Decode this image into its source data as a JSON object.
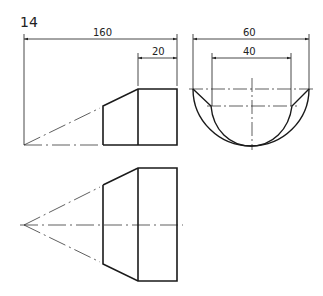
{
  "figure": {
    "number": "14",
    "views": {
      "front": {
        "name": "front-view"
      },
      "side": {
        "name": "side-view"
      },
      "top": {
        "name": "top-view"
      }
    },
    "dimensions": {
      "overall_length": "160",
      "cylinder_length": "20",
      "outer_diameter": "60",
      "inner_width": "40"
    }
  },
  "colors": {
    "line": "#1a1a1a",
    "thin": "#333333",
    "background": "#ffffff"
  }
}
